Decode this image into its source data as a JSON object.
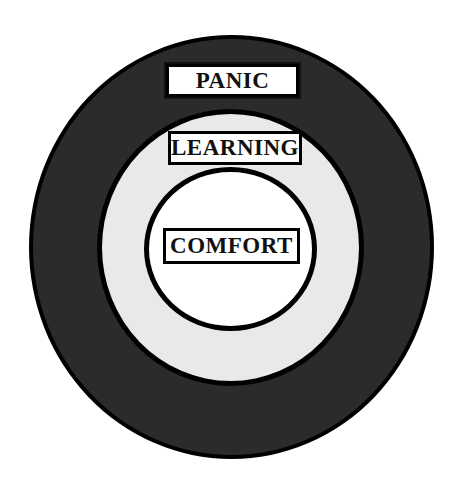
{
  "diagram": {
    "type": "concentric-zones",
    "zones": [
      {
        "id": "outer",
        "label": "PANIC",
        "fill": "#2b2b2b"
      },
      {
        "id": "middle",
        "label": "LEARNING",
        "fill": "#e9e9e9"
      },
      {
        "id": "inner",
        "label": "COMFORT",
        "fill": "#ffffff"
      }
    ],
    "outline_color": "#000000"
  }
}
